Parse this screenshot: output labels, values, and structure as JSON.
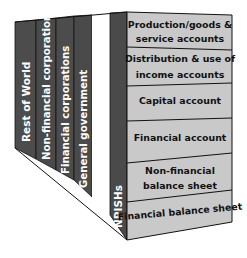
{
  "diagram": {
    "type": "3d-block",
    "colors": {
      "side_dark": "#4a4a4a",
      "side_gap": "#ffffff",
      "front_face": "#c9c9c9",
      "outline": "#111111",
      "side_text": "#ffffff",
      "front_text": "#111111"
    },
    "sectors": [
      {
        "label": "Rest of World"
      },
      {
        "label": "Non-financial corporations"
      },
      {
        "label": "Financial corporations"
      },
      {
        "label": "General government"
      },
      {
        "label": ""
      },
      {
        "label": "NPISHs"
      }
    ],
    "accounts": [
      {
        "line1": "Production/goods &",
        "line2": "service accounts"
      },
      {
        "line1": "Distribution & use of",
        "line2": "income accounts"
      },
      {
        "line1": "Capital account",
        "line2": ""
      },
      {
        "line1": "Financial account",
        "line2": ""
      },
      {
        "line1": "Non-financial",
        "line2": "balance sheet"
      },
      {
        "line1": "Financial balance sheet",
        "line2": ""
      }
    ]
  }
}
